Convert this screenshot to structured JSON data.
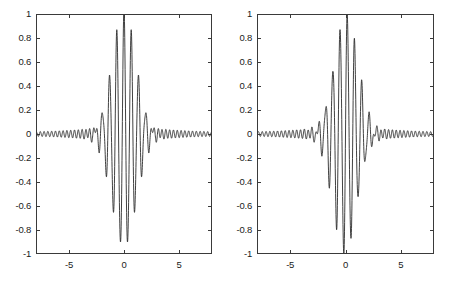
{
  "figure": {
    "background": "#ffffff",
    "line_color": "#2b2b2b",
    "axis_color": "#3a3a3a",
    "panel_count": 2
  },
  "chart_data": [
    {
      "type": "line",
      "title": "",
      "subtitle": "",
      "xlabel": "",
      "ylabel": "",
      "panel": "left",
      "panel_name": "even-gabor-wavelet",
      "description": "Symmetric (even / cosine) modulated wavelet with high-frequency ripples",
      "xlim": [
        -8,
        8
      ],
      "ylim": [
        -1,
        1
      ],
      "xticks": [
        -5,
        0,
        5
      ],
      "xticklabels": [
        "-5",
        "0",
        "5"
      ],
      "yticks": [
        -1,
        -0.8,
        -0.6,
        -0.4,
        -0.2,
        0,
        0.2,
        0.4,
        0.6,
        0.8,
        1
      ],
      "yticklabels": [
        "-1",
        "-0.8",
        "-0.6",
        "-0.4",
        "-0.2",
        "0",
        "0.2",
        "0.4",
        "0.6",
        "0.8",
        "1"
      ],
      "grid": false,
      "legend": null,
      "symmetry": "even",
      "peak_value": 1.0,
      "peak_x": 0.0,
      "min_value": -0.84,
      "min_x": [
        -0.33,
        0.33
      ],
      "side_peak_value": 0.43,
      "side_peak_x": [
        -0.66,
        0.66
      ],
      "carrier_period": 0.66,
      "envelope_sigma": 1.1,
      "ripple_period": 0.35,
      "ripple_amplitude": 0.055,
      "series": [
        {
          "name": "even-wavelet",
          "color": "#2b2b2b",
          "linewidth": 0.9,
          "formula": "exp(-(x/1.1)^2/2)*cos(2*pi*x/0.66) + 0.055*cos(2*pi*x/0.35)"
        }
      ]
    },
    {
      "type": "line",
      "title": "",
      "subtitle": "",
      "xlabel": "",
      "ylabel": "",
      "panel": "right",
      "panel_name": "odd-gabor-wavelet",
      "description": "Antisymmetric (odd / sine) modulated wavelet with high-frequency ripples",
      "xlim": [
        -8,
        8
      ],
      "ylim": [
        -1,
        1
      ],
      "xticks": [
        -5,
        0,
        5
      ],
      "xticklabels": [
        "-5",
        "0",
        "5"
      ],
      "yticks": [
        -1,
        -0.8,
        -0.6,
        -0.4,
        -0.2,
        0,
        0.2,
        0.4,
        0.6,
        0.8,
        1
      ],
      "yticklabels": [
        "-1",
        "-0.8",
        "-0.6",
        "-0.4",
        "-0.2",
        "0",
        "0.2",
        "0.4",
        "0.6",
        "0.8",
        "1"
      ],
      "grid": false,
      "legend": null,
      "symmetry": "odd",
      "peak_value": 0.95,
      "peak_x": 0.17,
      "min_value": -0.95,
      "min_x": -0.17,
      "side_peak_value": 0.64,
      "side_peak_x": -0.5,
      "side_trough_value": -0.64,
      "side_trough_x": 0.5,
      "carrier_period": 0.66,
      "envelope_sigma": 1.1,
      "ripple_period": 0.35,
      "ripple_amplitude": 0.055,
      "series": [
        {
          "name": "odd-wavelet",
          "color": "#2b2b2b",
          "linewidth": 0.9,
          "formula": "exp(-(x/1.1)^2/2)*sin(2*pi*x/0.66) + 0.055*sin(2*pi*x/0.35)"
        }
      ]
    }
  ]
}
